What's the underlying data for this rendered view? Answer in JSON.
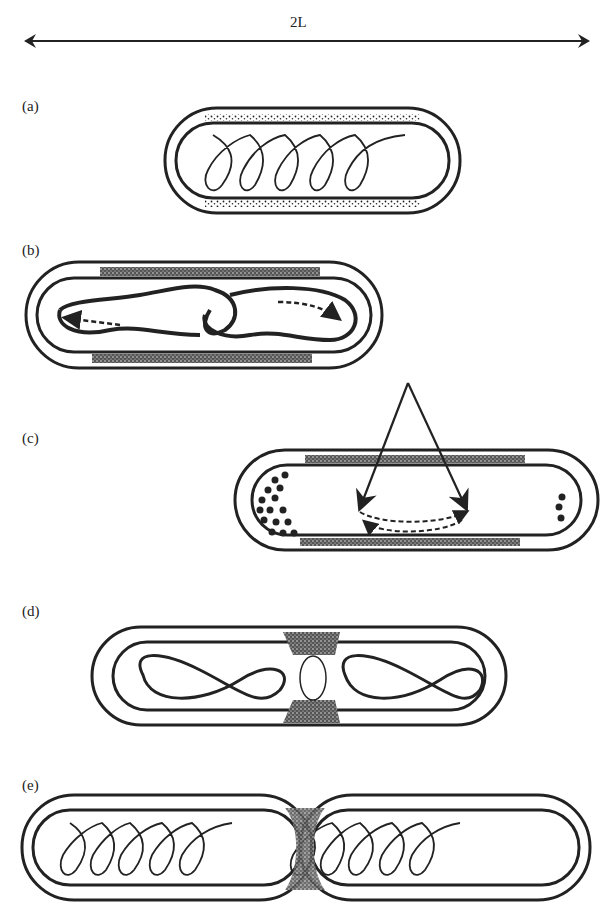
{
  "figure": {
    "scale_label": "2L",
    "panels": [
      {
        "id": "a",
        "label": "(a)"
      },
      {
        "id": "b",
        "label": "(b)"
      },
      {
        "id": "c",
        "label": "(c)"
      },
      {
        "id": "d",
        "label": "(d)"
      },
      {
        "id": "e",
        "label": "(e)"
      }
    ]
  }
}
